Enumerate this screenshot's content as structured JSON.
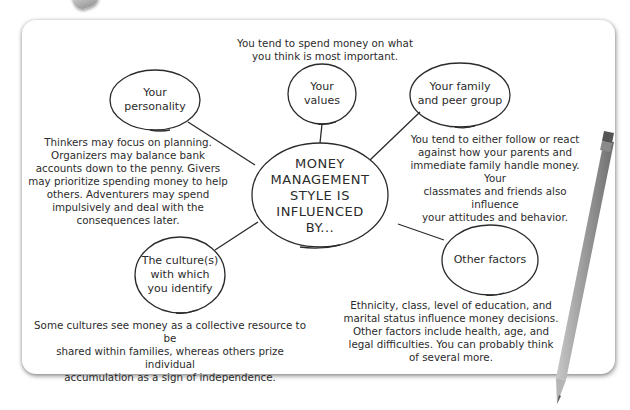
{
  "diagram": {
    "center": {
      "label_lines": [
        "MONEY",
        "MANAGEMENT",
        "STYLE IS",
        "INFLUENCED",
        "BY..."
      ]
    },
    "nodes": [
      {
        "id": "personality",
        "label_lines": [
          "Your",
          "personality"
        ],
        "description_lines": [
          "Thinkers may focus on planning.",
          "Organizers may balance bank",
          "accounts down to the penny. Givers",
          "may prioritize spending money to help",
          "others. Adventurers may spend",
          "impulsively and deal with the",
          "consequences later."
        ]
      },
      {
        "id": "values",
        "label_lines": [
          "Your",
          "values"
        ],
        "description_lines": [
          "You tend to spend money on what",
          "you think is most important."
        ]
      },
      {
        "id": "family",
        "label_lines": [
          "Your family",
          "and peer group"
        ],
        "description_lines": [
          "You tend to either follow or react",
          "against how your parents and",
          "immediate family handle money. Your",
          "classmates and friends also influence",
          "your attitudes and behavior."
        ]
      },
      {
        "id": "culture",
        "label_lines": [
          "The culture(s)",
          "with which",
          "you identify"
        ],
        "description_lines": [
          "Some cultures see money as a collective resource to be",
          "shared within families, whereas others prize individual",
          "accumulation as a sign of independence."
        ]
      },
      {
        "id": "other",
        "label_lines": [
          "Other factors"
        ],
        "description_lines": [
          "Ethnicity, class, level of education, and",
          "marital status influence money decisions.",
          "Other factors include health, age, and",
          "legal difficulties. You can probably think",
          "of several more."
        ]
      }
    ]
  },
  "colors": {
    "ink": "#2b2b2b",
    "card": "#ffffff",
    "pencil": "#9a9a9a"
  }
}
